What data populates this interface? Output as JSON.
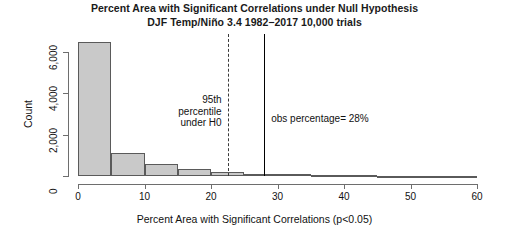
{
  "chart_data": {
    "type": "bar",
    "title": "Percent Area with Significant Correlations under Null Hypothesis",
    "subtitle": "DJF Temp/Niño 3.4 1982−2017 10,000 trials",
    "xlabel": "Percent Area with Significant Correlations (p<0.05)",
    "ylabel": "Count",
    "xlim": [
      0,
      60
    ],
    "ylim": [
      0,
      7000
    ],
    "grid": false,
    "legend": null,
    "bin_width": 5,
    "categories": [
      "0-5",
      "5-10",
      "10-15",
      "15-20",
      "20-25",
      "25-30",
      "30-35",
      "35-40",
      "40-45",
      "45-50",
      "50-55",
      "55-60"
    ],
    "bin_edges": [
      0,
      5,
      10,
      15,
      20,
      25,
      30,
      35,
      40,
      45,
      50,
      55,
      60
    ],
    "values": [
      6500,
      1100,
      600,
      350,
      200,
      120,
      90,
      60,
      30,
      10,
      5,
      0
    ],
    "xticks": [
      0,
      10,
      20,
      30,
      40,
      50,
      60
    ],
    "xtick_labels": [
      "0",
      "10",
      "20",
      "30",
      "40",
      "50",
      "60"
    ],
    "yticks": [
      0,
      2000,
      4000,
      6000
    ],
    "ytick_labels": [
      "0",
      "2,000",
      "4,000",
      "6,000"
    ],
    "bar_fill_color": "#c9c9c9",
    "bar_border_color": "#5a5a5a",
    "annotations": [
      {
        "name": "percentile-line",
        "type": "vline",
        "x": 22.5,
        "style": "dashed",
        "color": "#3a3a3a",
        "label": "95th\npercentile\nunder H0",
        "label_line_1": "95th",
        "label_line_2": "percentile",
        "label_line_3": "under H0"
      },
      {
        "name": "observed-line",
        "type": "vline",
        "x": 28,
        "style": "solid",
        "color": "#000000",
        "label": "obs percentage= 28%"
      }
    ]
  }
}
